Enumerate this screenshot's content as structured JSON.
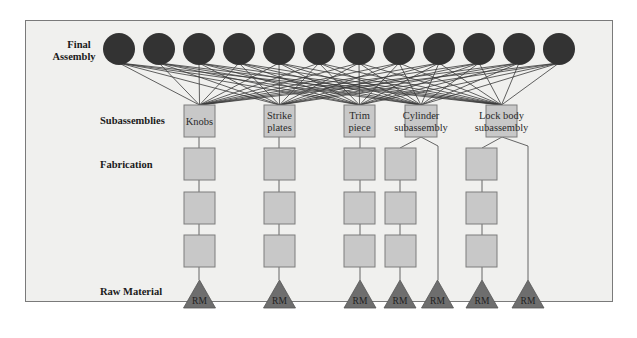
{
  "diagram": {
    "colors": {
      "background": "#f0f0ee",
      "frame": "#7a7a7a",
      "circle": "#333333",
      "box_fill": "#c8c8c8",
      "box_stroke": "#7c7c7c",
      "triangle_fill": "#6e6e6e",
      "line": "#3a3a3a"
    },
    "levels": {
      "final_assembly_line1": "Final",
      "final_assembly_line2": "Assembly",
      "subassemblies": "Subassemblies",
      "fabrication": "Fabrication",
      "raw_material": "Raw Material"
    },
    "final_assembly_count": 12,
    "subassemblies": [
      {
        "id": "knobs",
        "line1": "Knobs",
        "line2": ""
      },
      {
        "id": "strike-plates",
        "line1": "Strike",
        "line2": "plates"
      },
      {
        "id": "trim-piece",
        "line1": "Trim",
        "line2": "piece"
      },
      {
        "id": "cylinder-subassembly",
        "line1": "Cylinder",
        "line2": "subassembly"
      },
      {
        "id": "lock-body-subassembly",
        "line1": "Lock body",
        "line2": "subassembly"
      }
    ],
    "raw_material_label": "RM",
    "raw_material_count": 7
  }
}
